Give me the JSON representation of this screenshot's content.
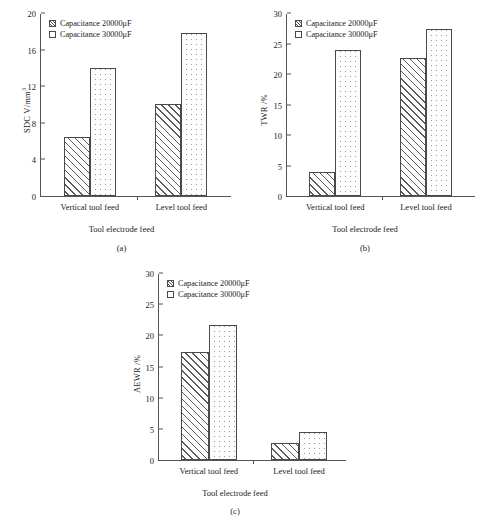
{
  "figure": {
    "panels": [
      {
        "caption": "(a)",
        "legend": [
          {
            "label": "Capacitance 20000μF",
            "pattern": "hatch"
          },
          {
            "label": "Capacitance 30000μF",
            "pattern": "dots"
          }
        ],
        "chart_data": {
          "type": "bar",
          "title": "",
          "categories": [
            "Vertical tool feed",
            "Level tool feed"
          ],
          "series": [
            {
              "name": "Capacitance 20000μF",
              "values": [
                6.5,
                10.1
              ]
            },
            {
              "name": "Capacitance 30000μF",
              "values": [
                14.0,
                17.8
              ]
            }
          ],
          "xlabel": "Tool electrode feed",
          "ylabel": "SDC V/mm³",
          "ylim": [
            0,
            20
          ],
          "yticks": [
            0,
            4,
            8,
            12,
            16,
            20
          ],
          "grid": false,
          "legend_position": "top-left"
        }
      },
      {
        "caption": "(b)",
        "legend": [
          {
            "label": "Capacitance 20000μF",
            "pattern": "hatch"
          },
          {
            "label": "Capacitance 30000μF",
            "pattern": "dots"
          }
        ],
        "chart_data": {
          "type": "bar",
          "title": "",
          "categories": [
            "Vertical tool feed",
            "Level tool feed"
          ],
          "series": [
            {
              "name": "Capacitance 20000μF",
              "values": [
                4.0,
                22.7
              ]
            },
            {
              "name": "Capacitance 30000μF",
              "values": [
                24.0,
                27.3
              ]
            }
          ],
          "xlabel": "Tool electrode feed",
          "ylabel": "TWR /%",
          "ylim": [
            0,
            30
          ],
          "yticks": [
            0,
            5,
            10,
            15,
            20,
            25,
            30
          ],
          "grid": false,
          "legend_position": "top-left"
        }
      },
      {
        "caption": "(c)",
        "legend": [
          {
            "label": "Capacitance 20000μF",
            "pattern": "hatch"
          },
          {
            "label": "Capacitance 30000μF",
            "pattern": "dots"
          }
        ],
        "chart_data": {
          "type": "bar",
          "title": "",
          "categories": [
            "Vertical tool feed",
            "Level tool feed"
          ],
          "series": [
            {
              "name": "Capacitance 20000μF",
              "values": [
                17.3,
                2.8
              ]
            },
            {
              "name": "Capacitance 30000μF",
              "values": [
                21.7,
                4.5
              ]
            }
          ],
          "xlabel": "Tool electrode feed",
          "ylabel": "AEWR /%",
          "ylim": [
            0,
            30
          ],
          "yticks": [
            0,
            5,
            10,
            15,
            20,
            25,
            30
          ],
          "grid": false,
          "legend_position": "top-left"
        }
      }
    ]
  }
}
